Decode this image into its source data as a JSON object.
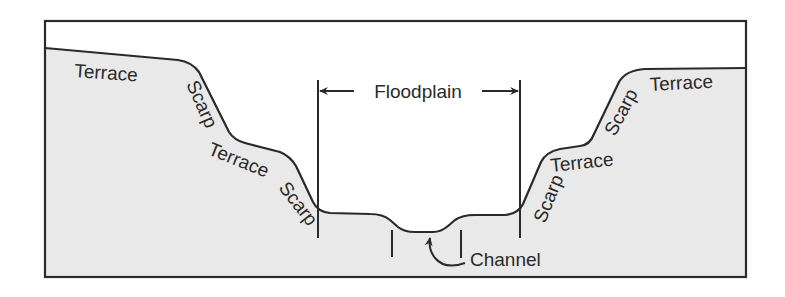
{
  "diagram": {
    "colors": {
      "background": "#ffffff",
      "ground_fill": "#e9e9e9",
      "line": "#2a2a2a"
    },
    "labels": {
      "left_upper_terrace": "Terrace",
      "left_upper_scarp": "Scarp",
      "left_lower_terrace": "Terrace",
      "left_lower_scarp": "Scarp",
      "floodplain": "Floodplain",
      "channel": "Channel",
      "right_lower_scarp": "Scarp",
      "right_lower_terrace": "Terrace",
      "right_upper_scarp": "Scarp",
      "right_upper_terrace": "Terrace"
    },
    "arrows": {
      "floodplain_left": "left-arrow",
      "floodplain_right": "right-arrow",
      "channel_pointer": "curved-arrow"
    }
  }
}
